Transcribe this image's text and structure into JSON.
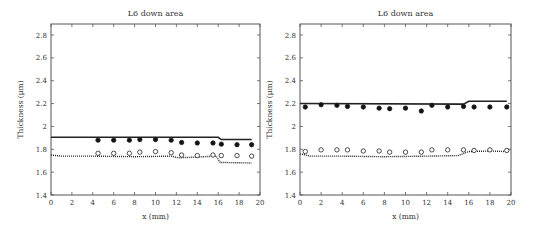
{
  "chart_data": [
    {
      "type": "line",
      "title": "L6 down area",
      "xlabel": "x (mm)",
      "ylabel": "Thickness (μm)",
      "xlim": [
        0,
        20
      ],
      "ylim": [
        1.4,
        2.9
      ],
      "xticks": [
        0,
        2,
        4,
        6,
        8,
        10,
        12,
        14,
        16,
        18,
        20
      ],
      "yticks": [
        1.4,
        1.6,
        1.8,
        2,
        2.2,
        2.4,
        2.6,
        2.8
      ],
      "grid": false,
      "series": [
        {
          "name": "upper-solid-line",
          "style": "solid",
          "x": [
            0,
            16,
            16.3,
            19.2
          ],
          "y": [
            1.905,
            1.905,
            1.885,
            1.885
          ]
        },
        {
          "name": "lower-dotted-line",
          "style": "dotted",
          "x": [
            0,
            1,
            4,
            8,
            11.5,
            12.2,
            15.8,
            16.2,
            19.2
          ],
          "y": [
            1.75,
            1.74,
            1.74,
            1.735,
            1.74,
            1.725,
            1.74,
            1.685,
            1.68
          ]
        },
        {
          "name": "filled-markers",
          "style": "filled-circle",
          "x": [
            4.5,
            6,
            7.5,
            8.5,
            10,
            11.5,
            12.5,
            14,
            15.5,
            16.3,
            17.8,
            19.2
          ],
          "y": [
            1.88,
            1.88,
            1.88,
            1.885,
            1.885,
            1.88,
            1.86,
            1.855,
            1.855,
            1.845,
            1.84,
            1.84
          ]
        },
        {
          "name": "open-markers",
          "style": "open-circle",
          "x": [
            4.5,
            6,
            7.5,
            8.5,
            10,
            11.5,
            12.5,
            14,
            15.5,
            16.3,
            17.8,
            19.2
          ],
          "y": [
            1.765,
            1.765,
            1.765,
            1.775,
            1.78,
            1.77,
            1.75,
            1.745,
            1.75,
            1.745,
            1.745,
            1.74
          ]
        }
      ]
    },
    {
      "type": "line",
      "title": "L6 down area",
      "xlabel": "x (mm)",
      "ylabel": "Thickness (μm)",
      "xlim": [
        0,
        20
      ],
      "ylim": [
        1.4,
        2.9
      ],
      "xticks": [
        0,
        2,
        4,
        6,
        8,
        10,
        12,
        14,
        16,
        18,
        20
      ],
      "yticks": [
        1.4,
        1.6,
        1.8,
        2,
        2.2,
        2.4,
        2.6,
        2.8
      ],
      "grid": false,
      "series": [
        {
          "name": "upper-solid-line",
          "style": "solid",
          "x": [
            0,
            15.5,
            16,
            19.6
          ],
          "y": [
            2.2,
            2.195,
            2.22,
            2.22
          ]
        },
        {
          "name": "lower-dotted-line",
          "style": "dotted",
          "x": [
            0,
            1,
            4,
            8,
            12,
            15,
            16,
            18,
            19.6
          ],
          "y": [
            1.76,
            1.74,
            1.74,
            1.735,
            1.74,
            1.745,
            1.78,
            1.785,
            1.78
          ]
        },
        {
          "name": "filled-markers",
          "style": "filled-circle",
          "x": [
            0.5,
            2,
            3.5,
            4.5,
            6,
            7.5,
            8.5,
            10,
            11.5,
            12.5,
            14,
            15.5,
            16.5,
            18,
            19.6
          ],
          "y": [
            2.17,
            2.19,
            2.185,
            2.175,
            2.17,
            2.16,
            2.155,
            2.16,
            2.135,
            2.185,
            2.17,
            2.175,
            2.17,
            2.17,
            2.17
          ]
        },
        {
          "name": "open-markers",
          "style": "open-circle",
          "x": [
            0.5,
            2,
            3.5,
            4.5,
            6,
            7.5,
            8.5,
            10,
            11.5,
            12.5,
            14,
            15.5,
            16.5,
            18,
            19.6
          ],
          "y": [
            1.78,
            1.795,
            1.795,
            1.795,
            1.785,
            1.785,
            1.775,
            1.775,
            1.775,
            1.795,
            1.795,
            1.795,
            1.79,
            1.795,
            1.79
          ]
        }
      ]
    }
  ],
  "layout": [
    {
      "left": 51,
      "right": 260,
      "top": 24,
      "bottom": 195,
      "svg_x": 0,
      "title_y": 16
    },
    {
      "left": 300,
      "right": 511,
      "top": 24,
      "bottom": 195,
      "svg_x": 0,
      "title_y": 16
    }
  ]
}
